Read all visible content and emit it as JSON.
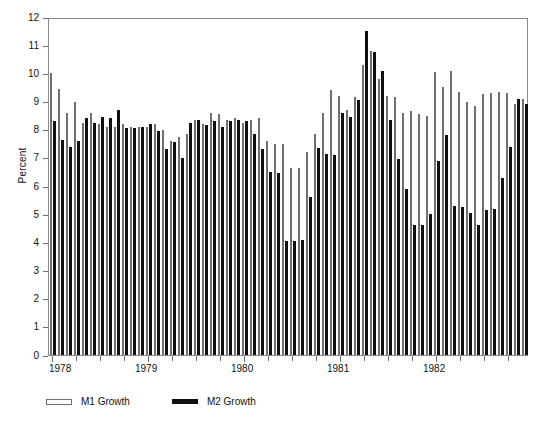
{
  "chart_data": {
    "type": "bar",
    "title": "",
    "subtitle": "",
    "xlabel": "",
    "ylabel": "Percent",
    "ylim": [
      0,
      12
    ],
    "ytick_step": 1,
    "yticks": [
      "0",
      "1",
      "2",
      "3",
      "4",
      "5",
      "6",
      "7",
      "8",
      "9",
      "10",
      "11",
      "12"
    ],
    "grid": false,
    "legend_position": "below-plot-left",
    "x_major_labels": [
      "1978",
      "1979",
      "1980",
      "1981",
      "1982"
    ],
    "x_tick_frequency": "quarterly",
    "x_frequency": "monthly",
    "x": [
      "1978-01",
      "1978-02",
      "1978-03",
      "1978-04",
      "1978-05",
      "1978-06",
      "1978-07",
      "1978-08",
      "1978-09",
      "1978-10",
      "1978-11",
      "1978-12",
      "1979-01",
      "1979-02",
      "1979-03",
      "1979-04",
      "1979-05",
      "1979-06",
      "1979-07",
      "1979-08",
      "1979-09",
      "1979-10",
      "1979-11",
      "1979-12",
      "1980-01",
      "1980-02",
      "1980-03",
      "1980-04",
      "1980-05",
      "1980-06",
      "1980-07",
      "1980-08",
      "1980-09",
      "1980-10",
      "1980-11",
      "1980-12",
      "1981-01",
      "1981-02",
      "1981-03",
      "1981-04",
      "1981-05",
      "1981-06",
      "1981-07",
      "1981-08",
      "1981-09",
      "1981-10",
      "1981-11",
      "1981-12",
      "1982-01",
      "1982-02",
      "1982-03",
      "1982-04",
      "1982-05",
      "1982-06",
      "1982-07",
      "1982-08",
      "1982-09",
      "1982-10",
      "1982-11",
      "1982-12"
    ],
    "series": [
      {
        "name": "M1 Growth",
        "color": "#ffffff",
        "edge_color": "#6f6f6f",
        "values": [
          10.0,
          9.45,
          8.6,
          9.0,
          8.25,
          8.6,
          8.2,
          8.1,
          8.1,
          8.2,
          8.1,
          8.1,
          8.1,
          8.2,
          8.0,
          7.6,
          7.75,
          7.85,
          8.35,
          8.2,
          8.6,
          8.55,
          8.35,
          8.4,
          8.25,
          8.35,
          8.4,
          7.6,
          7.5,
          7.5,
          6.65,
          6.65,
          7.2,
          7.85,
          8.6,
          9.4,
          9.2,
          8.7,
          9.15,
          10.3,
          10.8,
          9.8,
          9.2,
          9.15,
          8.6,
          8.65,
          8.55,
          8.5,
          10.05,
          9.5,
          10.1,
          9.35,
          9.0,
          8.85,
          9.25,
          9.3,
          9.35,
          9.3,
          8.9,
          9.1
        ]
      },
      {
        "name": "M2 Growth",
        "color": "#101010",
        "edge_color": "#101010",
        "values": [
          8.3,
          7.65,
          7.4,
          7.6,
          8.4,
          8.25,
          8.45,
          8.4,
          8.7,
          8.05,
          8.05,
          8.1,
          8.2,
          7.95,
          7.3,
          7.55,
          7.0,
          8.25,
          8.35,
          8.15,
          8.3,
          8.1,
          8.3,
          8.35,
          8.3,
          7.85,
          7.3,
          6.5,
          6.45,
          4.05,
          4.05,
          4.1,
          5.6,
          7.35,
          7.15,
          7.1,
          8.6,
          8.45,
          9.05,
          11.5,
          10.75,
          10.1,
          8.35,
          6.95,
          5.9,
          4.6,
          4.6,
          5.0,
          6.9,
          7.8,
          5.3,
          5.25,
          5.05,
          4.6,
          5.15,
          5.2,
          6.3,
          7.4,
          9.1,
          8.9
        ]
      }
    ]
  },
  "legend": {
    "items": [
      {
        "label": "M1 Growth",
        "style": "hollow"
      },
      {
        "label": "M2 Growth",
        "style": "solid"
      }
    ]
  },
  "axes": {
    "y_title": "Percent"
  },
  "colors": {
    "m1_fill": "#ffffff",
    "m1_edge": "#6f6f6f",
    "m2_fill": "#101010",
    "frame": "#8a8a8a",
    "text": "#111111"
  }
}
